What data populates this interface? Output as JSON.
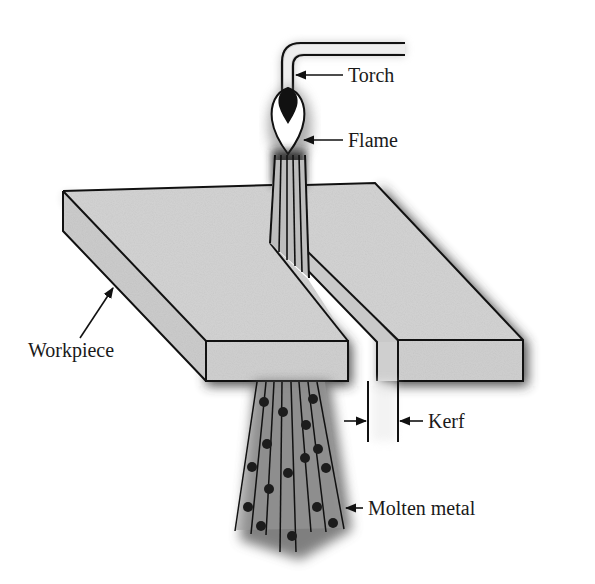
{
  "figure": {
    "type": "oxy-fuel flame cutting diagram",
    "colors": {
      "background": "#ffffff",
      "workpiece": "#d4d4d4",
      "workpiece_side": "#cfcfcf",
      "outline": "#111111",
      "shadow": "#2a2a2a",
      "flame_core": "#111111",
      "flame_outer": "#ffffff",
      "droplet": "#1e1e1e"
    }
  },
  "labels": {
    "torch": "Torch",
    "flame": "Flame",
    "workpiece": "Workpiece",
    "kerf": "Kerf",
    "molten_metal": "Molten metal"
  }
}
